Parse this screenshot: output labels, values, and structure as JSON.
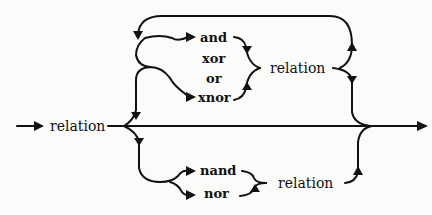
{
  "diagram": {
    "type": "syntax-railroad",
    "entry_label": "relation",
    "top_branch": {
      "operators": [
        "and",
        "xor",
        "or",
        "xnor"
      ],
      "operand": "relation",
      "repeatable": true
    },
    "bottom_branch": {
      "operators": [
        "nand",
        "nor"
      ],
      "operand": "relation",
      "repeatable": false
    },
    "colors": {
      "ink": "#111111",
      "background": "#fbfbf9"
    }
  }
}
